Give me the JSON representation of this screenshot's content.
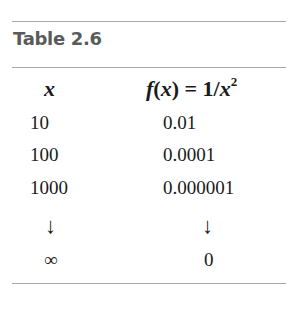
{
  "table": {
    "title": "Table 2.6",
    "headers": {
      "x": "x",
      "fx_prefix": "f",
      "fx_paren_open": "(",
      "fx_var": "x",
      "fx_paren_close": ")",
      "fx_equals": " = ",
      "fx_one": "1/",
      "fx_denom": "x",
      "fx_exp": "2"
    },
    "rows": [
      {
        "x": "10",
        "fx": "0.01"
      },
      {
        "x": "100",
        "fx": "0.0001"
      },
      {
        "x": "1000",
        "fx": "0.000001"
      },
      {
        "x": "↓",
        "fx": "↓"
      },
      {
        "x": "∞",
        "fx": "0"
      }
    ],
    "colors": {
      "title": "#5a5a5a",
      "rule": "#a8a8a8",
      "text": "#1a1a1a"
    }
  }
}
